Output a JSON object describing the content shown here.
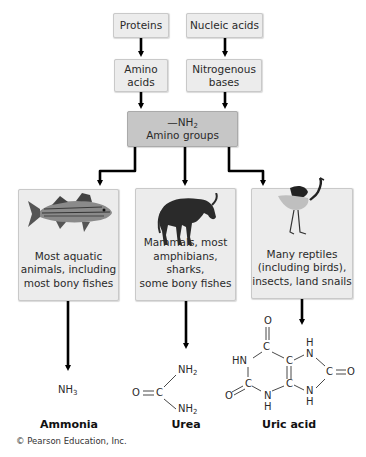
{
  "sources": [
    {
      "label": "Proteins"
    },
    {
      "label": "Nucleic acids"
    }
  ],
  "intermediates": [
    {
      "line1": "Amino",
      "line2": "acids"
    },
    {
      "line1": "Nitrogenous",
      "line2": "bases"
    }
  ],
  "amino_groups": {
    "formula_prefix": "—NH",
    "formula_sub": "2",
    "label": "Amino groups"
  },
  "organisms": [
    {
      "icon": "fish-icon",
      "lines": [
        "Most aquatic",
        "animals, including",
        "most bony fishes"
      ]
    },
    {
      "icon": "wildebeest-icon",
      "lines": [
        "Mammals, most",
        "amphibians, sharks,",
        "some bony fishes"
      ]
    },
    {
      "icon": "bird-icon",
      "lines": [
        "Many reptiles",
        "(including birds),",
        "insects, land snails"
      ]
    }
  ],
  "products": [
    {
      "name": "Ammonia",
      "formula": "NH",
      "formula_sub": "3"
    },
    {
      "name": "Urea",
      "atoms": {
        "O": "O",
        "C": "C",
        "NH_top": "NH",
        "NH_bottom": "NH",
        "sub": "2"
      }
    },
    {
      "name": "Uric acid",
      "atoms": {
        "O_top": "O",
        "C_top": "C",
        "HN": "HN",
        "C_left": "C",
        "O_left": "O",
        "N_bottom": "N",
        "H_bottom": "H",
        "C_ring_top": "C",
        "C_ring_bottom": "C",
        "N_top_right": "N",
        "H_top_right": "H",
        "C_right": "C",
        "O_right": "O",
        "N_bottom_right": "N",
        "H_bottom_right": "H"
      }
    }
  ],
  "copyright": "© Pearson Education, Inc.",
  "colors": {
    "box": "#ececec",
    "box_dark": "#c6c6c6",
    "arrow": "#000000"
  }
}
